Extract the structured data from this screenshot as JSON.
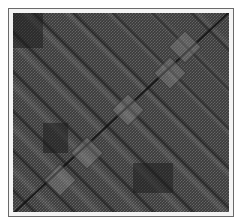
{
  "figure": {
    "type": "recurrence-plot-matrix",
    "colors": {
      "background": "#ffffff",
      "frame_border": "#6a6a6a",
      "plot_dark": "#3a3a3a",
      "checker_light": "#8c8c8c",
      "diagonal_line": "#111111"
    }
  }
}
